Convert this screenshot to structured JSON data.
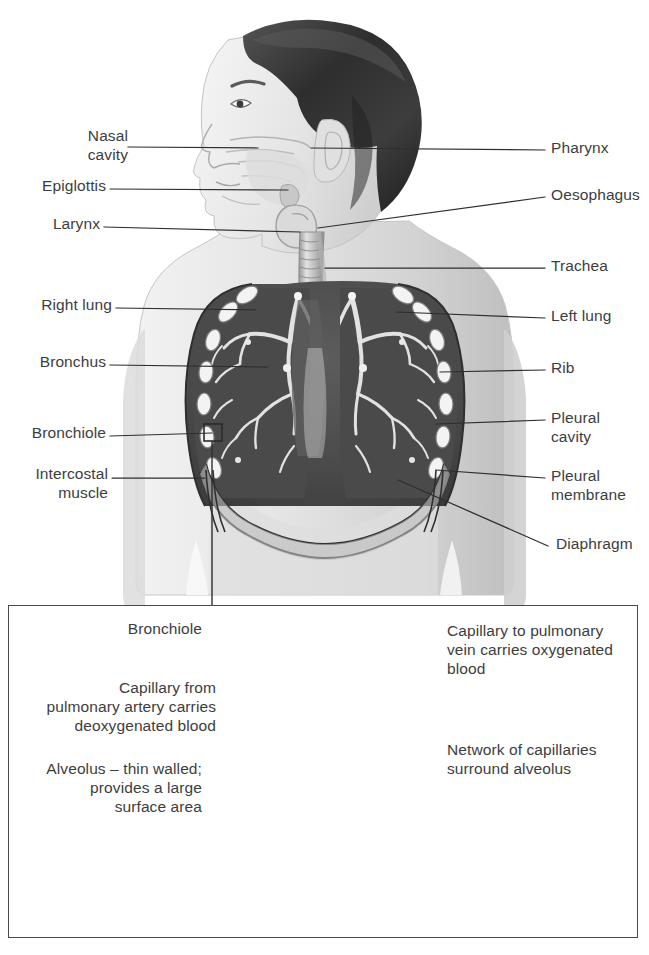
{
  "diagram": {
    "upper": {
      "caption": "Torso showing airway, lungs and chest wall",
      "labels_left": [
        {
          "id": "nasal-cavity",
          "text": "Nasal\ncavity",
          "x": 46,
          "y": 126,
          "lead_from": [
            128,
            147
          ],
          "lead_to": [
            258,
            148
          ]
        },
        {
          "id": "epiglottis",
          "text": "Epiglottis",
          "x": 22,
          "y": 176,
          "lead_from": [
            110,
            189
          ],
          "lead_to": [
            288,
            190
          ]
        },
        {
          "id": "larynx",
          "text": "Larynx",
          "x": 41,
          "y": 214,
          "lead_from": [
            104,
            227
          ],
          "lead_to": [
            300,
            232
          ]
        },
        {
          "id": "right-lung",
          "text": "Right lung",
          "x": 16,
          "y": 295,
          "lead_from": [
            116,
            308
          ],
          "lead_to": [
            256,
            310
          ]
        },
        {
          "id": "bronchus",
          "text": "Bronchus",
          "x": 23,
          "y": 352,
          "lead_from": [
            110,
            365
          ],
          "lead_to": [
            268,
            367
          ]
        },
        {
          "id": "bronchiole",
          "text": "Bronchiole",
          "x": 9,
          "y": 423,
          "lead_from": [
            110,
            436
          ],
          "lead_to": [
            212,
            432
          ]
        },
        {
          "id": "intercostal-muscle",
          "text": "Intercostal\nmuscle",
          "x": 12,
          "y": 464,
          "lead_from": [
            112,
            477
          ],
          "lead_to": [
            205,
            478
          ]
        }
      ],
      "labels_right": [
        {
          "id": "pharynx",
          "text": "Pharynx",
          "x": 551,
          "y": 138,
          "lead_from": [
            545,
            150
          ],
          "lead_to": [
            311,
            148
          ]
        },
        {
          "id": "oesophagus",
          "text": "Oesophagus",
          "x": 551,
          "y": 185,
          "lead_from": [
            545,
            197
          ],
          "lead_to": [
            318,
            228
          ]
        },
        {
          "id": "trachea",
          "text": "Trachea",
          "x": 551,
          "y": 256,
          "lead_from": [
            545,
            268
          ],
          "lead_to": [
            325,
            268
          ]
        },
        {
          "id": "left-lung",
          "text": "Left lung",
          "x": 551,
          "y": 306,
          "lead_from": [
            545,
            318
          ],
          "lead_to": [
            396,
            312
          ]
        },
        {
          "id": "rib",
          "text": "Rib",
          "x": 551,
          "y": 358,
          "lead_from": [
            545,
            370
          ],
          "lead_to": [
            440,
            372
          ]
        },
        {
          "id": "pleural-cavity",
          "text": "Pleural\ncavity",
          "x": 551,
          "y": 408,
          "lead_from": [
            545,
            420
          ],
          "lead_to": [
            436,
            424
          ]
        },
        {
          "id": "pleural-membrane",
          "text": "Pleural\nmembrane",
          "x": 551,
          "y": 466,
          "lead_from": [
            545,
            478
          ],
          "lead_to": [
            436,
            470
          ]
        },
        {
          "id": "diaphragm",
          "text": "Diaphragm",
          "x": 556,
          "y": 534,
          "lead_from": [
            548,
            546
          ],
          "lead_to": [
            398,
            480
          ]
        }
      ]
    },
    "lower_panel": {
      "caption": "Alveolus with surrounding capillary network",
      "labels_left": [
        {
          "id": "bronchiole-detail",
          "text": "Bronchiole",
          "x": 115,
          "y": 619,
          "lead_from": [
            205,
            632
          ],
          "lead_to": [
            290,
            633
          ]
        },
        {
          "id": "capillary-from-artery",
          "text": "Capillary from\npulmonary artery carries\ndeoxygenated blood",
          "x": 26,
          "y": 678,
          "lead_from": [
            219,
            711
          ],
          "lead_to": [
            293,
            710
          ]
        },
        {
          "id": "alveolus",
          "text": "Alveolus – thin walled;\nprovides a large\nsurface area",
          "x": 34,
          "y": 759,
          "lead_from": [
            205,
            791
          ],
          "lead_to": [
            305,
            791
          ]
        }
      ],
      "labels_right": [
        {
          "id": "capillary-to-vein",
          "text": "Capillary to pulmonary\nvein carries oxygenated\nblood",
          "x": 447,
          "y": 621,
          "lead_from": [
            441,
            661
          ],
          "lead_to": [
            345,
            660
          ]
        },
        {
          "id": "network-of-capillaries",
          "text": "Network of capillaries\nsurround alveolus",
          "x": 447,
          "y": 740,
          "lead_from": [
            441,
            752
          ],
          "lead_to": [
            355,
            757
          ]
        }
      ]
    },
    "connector": {
      "id": "zoom-connector",
      "from": [
        212,
        432
      ],
      "to": [
        212,
        605
      ]
    }
  },
  "colors": {
    "text": "#3d3d3d",
    "line": "#2f2f2f",
    "panel_border": "#4a4a4a",
    "skin_light": "#e9e9e9",
    "skin_mid": "#d2d2d2",
    "skin_shadow": "#b9b9b9",
    "hair_dark": "#3a3a3a",
    "lung_cavity": "#4d4d4d",
    "lung_cavity_dark": "#3c3c3c",
    "bronchial_tree": "#efefef",
    "rib": "#f2f2f2",
    "alveolus_light": "#d8d8d8",
    "alveolus_mid": "#a9a9a9",
    "alveolus_dark": "#7c7c7c",
    "background": "#ffffff"
  }
}
